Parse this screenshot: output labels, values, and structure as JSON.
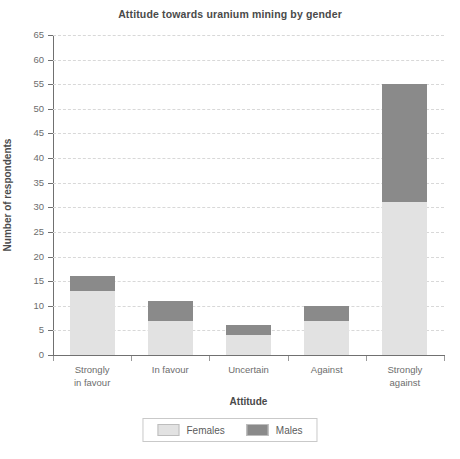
{
  "chart_data": {
    "type": "bar",
    "subtype": "stacked-vertical",
    "title": "Attitude towards uranium mining by gender",
    "xlabel": "Attitude",
    "ylabel": "Number of respondents",
    "categories": [
      "Strongly\nin favour",
      "In favour",
      "Uncertain",
      "Against",
      "Strongly\nagainst"
    ],
    "series": [
      {
        "name": "Females",
        "values": [
          13,
          7,
          4,
          7,
          31
        ],
        "color": "#e2e2e2"
      },
      {
        "name": "Males",
        "values": [
          3,
          4,
          2,
          3,
          24
        ],
        "color": "#8a8a8a"
      }
    ],
    "totals": [
      16,
      11,
      6,
      10,
      55
    ],
    "ylim": [
      0,
      65
    ],
    "ytick_step": 5,
    "yticks": [
      0,
      5,
      10,
      15,
      20,
      25,
      30,
      35,
      40,
      45,
      50,
      55,
      60,
      65
    ],
    "grid": "horizontal-dashed",
    "legend_position": "bottom-center",
    "legend_entries": [
      "Females",
      "Males"
    ]
  }
}
